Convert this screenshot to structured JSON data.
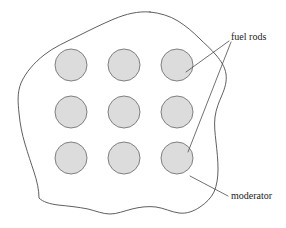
{
  "diagram": {
    "background_color": "#ffffff",
    "moderator": {
      "name": "moderator",
      "label": "moderator",
      "outline_color": "#4d4d4d",
      "fill_color": "#ffffff",
      "outline_width": 0.9
    },
    "fuel_rods": {
      "name": "fuel rods",
      "label": "fuel rods",
      "count": 9,
      "rows": 3,
      "columns": 3,
      "fill_color": "#dcdcdc",
      "stroke_color": "#808080",
      "radius": 16,
      "centers": [
        {
          "cx": 71,
          "cy": 65
        },
        {
          "cx": 124,
          "cy": 65
        },
        {
          "cx": 177,
          "cy": 65
        },
        {
          "cx": 71,
          "cy": 112
        },
        {
          "cx": 124,
          "cy": 112
        },
        {
          "cx": 177,
          "cy": 112
        },
        {
          "cx": 71,
          "cy": 158
        },
        {
          "cx": 124,
          "cy": 158
        },
        {
          "cx": 177,
          "cy": 158
        }
      ]
    },
    "leader_lines": {
      "stroke_color": "#4d4d4d",
      "stroke_width": 0.8,
      "fuel_rods_upper": "M 229 41 L 186 72",
      "fuel_rods_lower": "M 231 42 L 188 152",
      "moderator": "M 228 196 L 190 176"
    },
    "labels": {
      "fuel_rods": {
        "text": "fuel rods",
        "x": 231,
        "y": 40,
        "anchor": "start"
      },
      "moderator": {
        "text": "moderator",
        "x": 231,
        "y": 199,
        "anchor": "start"
      }
    }
  }
}
